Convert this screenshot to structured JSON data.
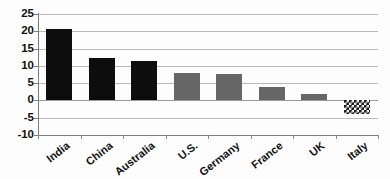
{
  "chart_data": {
    "type": "bar",
    "title": "",
    "subtitle": "",
    "xlabel": "",
    "ylabel": "",
    "categories": [
      "India",
      "China",
      "Australia",
      "U.S.",
      "Germany",
      "France",
      "UK",
      "Italy"
    ],
    "values": [
      20.8,
      12.2,
      11.4,
      8.0,
      7.7,
      4.0,
      1.8,
      -4.0
    ],
    "series": [
      {
        "name": "",
        "values": [
          20.8,
          12.2,
          11.4,
          8.0,
          7.7,
          4.0,
          1.8,
          -4.0
        ]
      }
    ],
    "bar_styles": [
      "black",
      "black",
      "black",
      "gray",
      "gray",
      "gray",
      "gray",
      "hatch"
    ],
    "ylim": [
      -10,
      25
    ],
    "ytick_labels": [
      "25",
      "20",
      "15",
      "10",
      "5",
      "0",
      "-5",
      "-10"
    ],
    "ytick_values": [
      25,
      20,
      15,
      10,
      5,
      0,
      -5,
      -10
    ],
    "grid": true,
    "legend": "none",
    "colors": {
      "bar_black": "#0d0d0d",
      "bar_gray": "#666666",
      "bar_hatch": "#1b1b1b",
      "gridline": "#b9b9b9",
      "axis": "#7d7d7d",
      "text": "#111111",
      "background": "#fdfdfd"
    }
  }
}
